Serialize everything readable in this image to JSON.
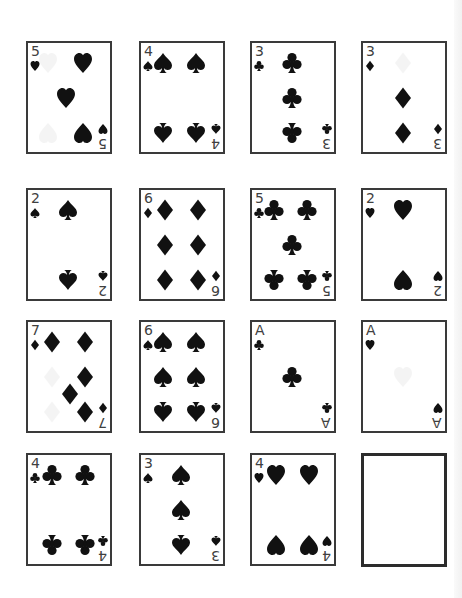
{
  "game": {
    "name": "card-grid",
    "colors": {
      "background": "#ffffff",
      "card_border": "#3a3a3a",
      "pip": "#111111",
      "rank_text": "#404040"
    },
    "layout": {
      "columns_x": [
        26,
        139,
        250,
        361
      ],
      "rows_y": [
        41,
        188,
        320,
        453
      ],
      "card_width": 86,
      "card_height": 113
    }
  },
  "cards": [
    {
      "row": 0,
      "col": 0,
      "rank": "5",
      "suit": "hearts",
      "suit_icon": "heart-icon",
      "pips": [
        [
          20,
          20,
          false,
          true
        ],
        [
          55,
          20,
          false,
          false
        ],
        [
          38,
          55,
          false,
          false
        ],
        [
          20,
          90,
          true,
          true
        ],
        [
          55,
          90,
          true,
          false
        ]
      ]
    },
    {
      "row": 0,
      "col": 1,
      "rank": "4",
      "suit": "spades",
      "suit_icon": "spade-icon",
      "pips": [
        [
          22,
          20,
          false,
          false
        ],
        [
          55,
          20,
          false,
          false
        ],
        [
          22,
          90,
          true,
          false
        ],
        [
          55,
          90,
          true,
          false
        ]
      ]
    },
    {
      "row": 0,
      "col": 2,
      "rank": "3",
      "suit": "clubs",
      "suit_icon": "club-icon",
      "pips": [
        [
          40,
          20,
          false,
          false
        ],
        [
          40,
          55,
          false,
          false
        ],
        [
          40,
          90,
          true,
          false
        ]
      ]
    },
    {
      "row": 0,
      "col": 3,
      "rank": "3",
      "suit": "diamonds",
      "suit_icon": "diamond-icon",
      "pips": [
        [
          40,
          20,
          false,
          true
        ],
        [
          40,
          55,
          false,
          false
        ],
        [
          40,
          90,
          true,
          false
        ]
      ]
    },
    {
      "row": 1,
      "col": 0,
      "rank": "2",
      "suit": "spades",
      "suit_icon": "spade-icon",
      "pips": [
        [
          40,
          20,
          false,
          false
        ],
        [
          40,
          90,
          true,
          false
        ]
      ]
    },
    {
      "row": 1,
      "col": 1,
      "rank": "6",
      "suit": "diamonds",
      "suit_icon": "diamond-icon",
      "pips": [
        [
          24,
          20,
          false,
          false
        ],
        [
          57,
          20,
          false,
          false
        ],
        [
          24,
          55,
          false,
          false
        ],
        [
          57,
          55,
          false,
          false
        ],
        [
          24,
          90,
          true,
          false
        ],
        [
          57,
          90,
          true,
          false
        ]
      ]
    },
    {
      "row": 1,
      "col": 2,
      "rank": "5",
      "suit": "clubs",
      "suit_icon": "club-icon",
      "pips": [
        [
          22,
          20,
          false,
          false
        ],
        [
          55,
          20,
          false,
          false
        ],
        [
          40,
          55,
          false,
          false
        ],
        [
          22,
          90,
          true,
          false
        ],
        [
          55,
          90,
          true,
          false
        ]
      ]
    },
    {
      "row": 1,
      "col": 3,
      "rank": "2",
      "suit": "hearts",
      "suit_icon": "heart-icon",
      "pips": [
        [
          40,
          20,
          false,
          false
        ],
        [
          40,
          90,
          true,
          false
        ]
      ]
    },
    {
      "row": 2,
      "col": 0,
      "rank": "7",
      "suit": "diamonds",
      "suit_icon": "diamond-icon",
      "pips": [
        [
          24,
          20,
          false,
          false
        ],
        [
          57,
          20,
          false,
          false
        ],
        [
          24,
          55,
          false,
          true
        ],
        [
          57,
          55,
          false,
          false
        ],
        [
          42,
          72,
          false,
          false
        ],
        [
          24,
          90,
          true,
          true
        ],
        [
          57,
          90,
          true,
          false
        ]
      ]
    },
    {
      "row": 2,
      "col": 1,
      "rank": "6",
      "suit": "spades",
      "suit_icon": "spade-icon",
      "pips": [
        [
          22,
          20,
          false,
          false
        ],
        [
          55,
          20,
          false,
          false
        ],
        [
          22,
          55,
          false,
          false
        ],
        [
          55,
          55,
          false,
          false
        ],
        [
          22,
          90,
          true,
          false
        ],
        [
          55,
          90,
          true,
          false
        ]
      ]
    },
    {
      "row": 2,
      "col": 2,
      "rank": "A",
      "suit": "clubs",
      "suit_icon": "club-icon",
      "pips": [
        [
          40,
          55,
          false,
          false
        ]
      ]
    },
    {
      "row": 2,
      "col": 3,
      "rank": "A",
      "suit": "hearts",
      "suit_icon": "heart-icon",
      "pips": [
        [
          40,
          55,
          false,
          true
        ]
      ]
    },
    {
      "row": 3,
      "col": 0,
      "rank": "4",
      "suit": "clubs",
      "suit_icon": "club-icon",
      "pips": [
        [
          24,
          20,
          false,
          false
        ],
        [
          57,
          20,
          false,
          false
        ],
        [
          24,
          90,
          true,
          false
        ],
        [
          57,
          90,
          true,
          false
        ]
      ]
    },
    {
      "row": 3,
      "col": 1,
      "rank": "3",
      "suit": "spades",
      "suit_icon": "spade-icon",
      "pips": [
        [
          40,
          20,
          false,
          false
        ],
        [
          40,
          55,
          false,
          false
        ],
        [
          40,
          90,
          true,
          false
        ]
      ]
    },
    {
      "row": 3,
      "col": 2,
      "rank": "4",
      "suit": "hearts",
      "suit_icon": "heart-icon",
      "pips": [
        [
          24,
          20,
          false,
          false
        ],
        [
          57,
          20,
          false,
          false
        ],
        [
          24,
          90,
          true,
          false
        ],
        [
          57,
          90,
          true,
          false
        ]
      ]
    }
  ],
  "empty_slots": [
    {
      "row": 3,
      "col": 3,
      "label": ""
    }
  ]
}
